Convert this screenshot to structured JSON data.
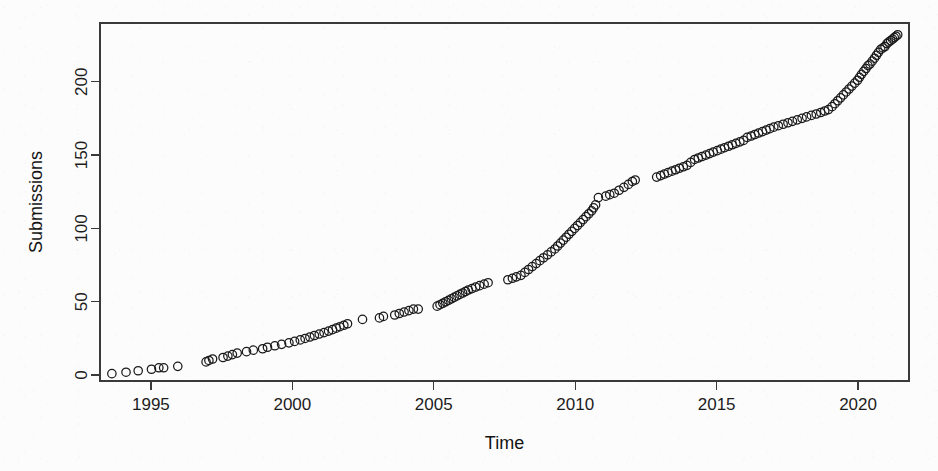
{
  "figure": {
    "width": 938,
    "height": 471,
    "background_color": "#fcfcfc",
    "marker_color": "#1a1a1a",
    "axis_color": "#3a3a3a"
  },
  "chart_data": {
    "type": "scatter",
    "title": "",
    "subtitle": "",
    "xlabel": "Time",
    "ylabel": "Submissions",
    "xlim": [
      1993.2,
      1993.2,
      2021.8
    ],
    "x_range": [
      1993.2,
      2021.8
    ],
    "y_range": [
      -4,
      240
    ],
    "ylim": [
      -4,
      240
    ],
    "xticks": [
      1995,
      2000,
      2005,
      2010,
      2015,
      2020
    ],
    "xticklabels": [
      "1995",
      "2000",
      "2005",
      "2010",
      "2015",
      "2020"
    ],
    "yticks": [
      0,
      50,
      100,
      150,
      200
    ],
    "yticklabels": [
      "0",
      "50",
      "100",
      "150",
      "200"
    ],
    "grid": false,
    "legend": null,
    "marker": "open-circle",
    "marker_size": 4.2,
    "series": [
      {
        "name": "Submissions",
        "x": [
          1993.62,
          1994.12,
          1994.55,
          1995.02,
          1995.28,
          1995.45,
          1995.95,
          1996.95,
          1997.05,
          1997.18,
          1997.55,
          1997.72,
          1997.88,
          1998.05,
          1998.38,
          1998.62,
          1998.95,
          1999.12,
          1999.38,
          1999.62,
          1999.88,
          2000.08,
          2000.28,
          2000.45,
          2000.62,
          2000.78,
          2000.95,
          2001.12,
          2001.28,
          2001.42,
          2001.55,
          2001.68,
          2001.82,
          2001.95,
          2002.48,
          2003.08,
          2003.22,
          2003.62,
          2003.78,
          2003.95,
          2004.12,
          2004.28,
          2004.45,
          2005.12,
          2005.22,
          2005.32,
          2005.42,
          2005.52,
          2005.62,
          2005.72,
          2005.82,
          2005.92,
          2006.02,
          2006.12,
          2006.22,
          2006.35,
          2006.48,
          2006.62,
          2006.78,
          2006.92,
          2007.62,
          2007.78,
          2007.92,
          2008.08,
          2008.22,
          2008.35,
          2008.48,
          2008.62,
          2008.75,
          2008.88,
          2009.02,
          2009.15,
          2009.28,
          2009.38,
          2009.48,
          2009.58,
          2009.68,
          2009.78,
          2009.88,
          2009.98,
          2010.08,
          2010.18,
          2010.28,
          2010.38,
          2010.48,
          2010.58,
          2010.65,
          2010.72,
          2010.82,
          2011.08,
          2011.22,
          2011.38,
          2011.55,
          2011.72,
          2011.88,
          2012.02,
          2012.12,
          2012.88,
          2013.02,
          2013.15,
          2013.28,
          2013.42,
          2013.55,
          2013.68,
          2013.82,
          2013.95,
          2014.08,
          2014.22,
          2014.35,
          2014.48,
          2014.62,
          2014.75,
          2014.88,
          2015.02,
          2015.15,
          2015.28,
          2015.42,
          2015.55,
          2015.68,
          2015.82,
          2015.95,
          2016.08,
          2016.22,
          2016.35,
          2016.48,
          2016.62,
          2016.75,
          2016.88,
          2017.02,
          2017.18,
          2017.35,
          2017.52,
          2017.68,
          2017.85,
          2018.02,
          2018.18,
          2018.35,
          2018.52,
          2018.68,
          2018.82,
          2018.95,
          2019.08,
          2019.18,
          2019.28,
          2019.38,
          2019.48,
          2019.58,
          2019.68,
          2019.78,
          2019.88,
          2019.98,
          2020.05,
          2020.12,
          2020.2,
          2020.28,
          2020.35,
          2020.42,
          2020.5,
          2020.58,
          2020.65,
          2020.72,
          2020.8,
          2020.88,
          2020.95,
          2021.02,
          2021.08,
          2021.15,
          2021.22,
          2021.28,
          2021.34,
          2021.4
        ],
        "y": [
          1,
          2,
          3,
          4,
          5,
          5,
          6,
          9,
          10,
          11,
          12,
          13,
          14,
          15,
          16,
          17,
          18,
          19,
          20,
          21,
          22,
          23,
          24,
          25,
          26,
          27,
          28,
          29,
          30,
          31,
          32,
          33,
          34,
          35,
          38,
          39,
          40,
          41,
          42,
          43,
          44,
          45,
          45,
          47,
          48,
          49,
          50,
          51,
          52,
          53,
          54,
          55,
          56,
          57,
          58,
          59,
          60,
          61,
          62,
          63,
          65,
          66,
          67,
          68,
          70,
          72,
          74,
          76,
          78,
          80,
          82,
          84,
          86,
          88,
          90,
          92,
          94,
          96,
          98,
          100,
          102,
          104,
          106,
          108,
          110,
          112,
          114,
          116,
          121,
          122,
          123,
          124,
          126,
          128,
          130,
          132,
          133,
          135,
          136,
          137,
          138,
          139,
          140,
          141,
          142,
          143,
          145,
          147,
          148,
          149,
          150,
          151,
          152,
          153,
          154,
          155,
          156,
          157,
          158,
          159,
          160,
          162,
          163,
          164,
          165,
          166,
          167,
          168,
          169,
          170,
          171,
          172,
          173,
          174,
          175,
          176,
          177,
          178,
          179,
          180,
          181,
          183,
          185,
          187,
          189,
          191,
          193,
          195,
          197,
          199,
          201,
          203,
          205,
          207,
          209,
          211,
          212,
          214,
          216,
          218,
          220,
          222,
          223,
          224,
          226,
          227,
          228,
          229,
          230,
          231,
          232
        ]
      }
    ]
  }
}
